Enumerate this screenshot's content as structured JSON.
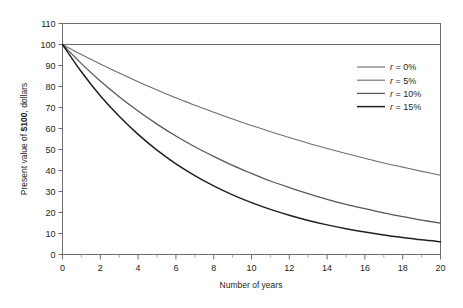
{
  "chart_data": {
    "type": "line",
    "title": "",
    "xlabel": "Number of years",
    "ylabel": "Present value of $100, dollars",
    "ylabel_parts": {
      "prefix": "Present value of ",
      "bold": "$100",
      "suffix": ", dollars"
    },
    "xlim": [
      0,
      20
    ],
    "ylim": [
      0,
      110
    ],
    "xticks": [
      0,
      2,
      4,
      6,
      8,
      10,
      12,
      14,
      16,
      18,
      20
    ],
    "xtick_labels": [
      "0",
      "2",
      "4",
      "6",
      "8",
      "10",
      "12",
      "14",
      "16",
      "18",
      "20"
    ],
    "xminor_ticks": [
      1,
      3,
      5,
      7,
      9,
      11,
      13,
      15,
      17,
      19
    ],
    "yticks": [
      0,
      10,
      20,
      30,
      40,
      50,
      60,
      70,
      80,
      90,
      100,
      110
    ],
    "ytick_labels": [
      "0",
      "10",
      "20",
      "30",
      "40",
      "50",
      "60",
      "70",
      "80",
      "90",
      "100",
      "110"
    ],
    "grid": false,
    "legend_position": "upper right",
    "x": [
      0,
      1,
      2,
      3,
      4,
      5,
      6,
      7,
      8,
      9,
      10,
      11,
      12,
      13,
      14,
      15,
      16,
      17,
      18,
      19,
      20
    ],
    "series": [
      {
        "name": "r = 0%",
        "rate": 0,
        "color": "#6d6e71",
        "width": 1.1,
        "values": [
          100,
          100,
          100,
          100,
          100,
          100,
          100,
          100,
          100,
          100,
          100,
          100,
          100,
          100,
          100,
          100,
          100,
          100,
          100,
          100,
          100
        ]
      },
      {
        "name": "r = 5%",
        "rate": 5,
        "color": "#6d6e71",
        "width": 1.1,
        "values": [
          100,
          95.2,
          90.7,
          86.4,
          82.3,
          78.4,
          74.6,
          71.1,
          67.7,
          64.5,
          61.4,
          58.5,
          55.7,
          53.0,
          50.5,
          48.1,
          45.8,
          43.6,
          41.6,
          39.6,
          37.7
        ]
      },
      {
        "name": "r = 10%",
        "rate": 10,
        "color": "#58595b",
        "width": 1.3,
        "values": [
          100,
          90.9,
          82.6,
          75.1,
          68.3,
          62.1,
          56.4,
          51.3,
          46.7,
          42.4,
          38.6,
          35.0,
          31.9,
          29.0,
          26.3,
          23.9,
          21.8,
          19.8,
          18.0,
          16.4,
          14.9
        ]
      },
      {
        "name": "r = 15%",
        "rate": 15,
        "color": "#231f20",
        "width": 1.5,
        "values": [
          100,
          87.0,
          75.6,
          65.8,
          57.2,
          49.7,
          43.2,
          37.6,
          32.7,
          28.4,
          24.7,
          21.5,
          18.7,
          16.2,
          14.1,
          12.3,
          10.7,
          9.3,
          8.1,
          7.0,
          6.1
        ]
      }
    ]
  },
  "legend": {
    "items": [
      {
        "label": "r = 0%",
        "r": "r",
        "rest": " = 0%"
      },
      {
        "label": "r = 5%",
        "r": "r",
        "rest": " = 5%"
      },
      {
        "label": "r = 10%",
        "r": "r",
        "rest": " = 10%"
      },
      {
        "label": "r = 15%",
        "r": "r",
        "rest": " = 15%"
      }
    ]
  },
  "colors": {
    "frame": "#6d6e71",
    "background": "#ffffff",
    "text": "#231f20"
  }
}
